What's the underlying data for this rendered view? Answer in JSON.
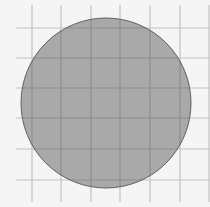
{
  "diagram": {
    "type": "circle-on-grid",
    "background_color": "#f5f5f5",
    "grid": {
      "color": "#c2c2c2",
      "overlay_color": "#8e8e8e",
      "stroke_width": 1.2,
      "vertical_lines_x": [
        32,
        61,
        91,
        120,
        150,
        180,
        209
      ],
      "vertical_y_range": [
        5,
        202
      ],
      "horizontal_lines_y": [
        28,
        58,
        88,
        118,
        149,
        180
      ],
      "horizontal_x_range": [
        16,
        210
      ]
    },
    "circle": {
      "cx": 106,
      "cy": 103,
      "r": 85,
      "fill": "#a9a9a9",
      "stroke": "#5f5f5f",
      "stroke_width": 1
    }
  }
}
